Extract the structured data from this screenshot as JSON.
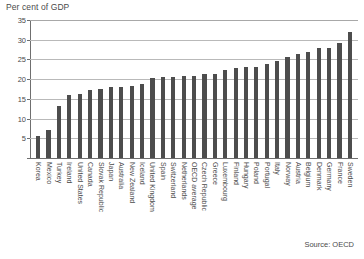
{
  "chart_data": {
    "type": "bar",
    "title": "",
    "ylabel": "Per cent of GDP",
    "xlabel": "",
    "ylim": [
      0,
      35
    ],
    "yticks": [
      0,
      5,
      10,
      15,
      20,
      25,
      30,
      35
    ],
    "grid": true,
    "legend": false,
    "source_note": "Source: OECD",
    "bar_color": "#4d4d4d",
    "categories": [
      "Korea",
      "Mexico",
      "Turkey",
      "Ireland",
      "United States",
      "Canada",
      "Slovak Republic",
      "Japan",
      "Australia",
      "New Zealand",
      "Iceland",
      "United Kingdom",
      "Spain",
      "Switzerland",
      "Netherlands",
      "OECD average",
      "Czech Republic",
      "Greece",
      "Luxembourg",
      "Finland",
      "Hungary",
      "Poland",
      "Portugal",
      "Italy",
      "Norway",
      "Austria",
      "Belgium",
      "Denmark",
      "Germany",
      "France",
      "Sweden"
    ],
    "values": [
      5.6,
      7.0,
      13.2,
      16.0,
      16.2,
      17.3,
      17.5,
      17.9,
      18.0,
      18.2,
      18.8,
      20.4,
      20.5,
      20.6,
      20.8,
      20.9,
      21.3,
      21.4,
      22.4,
      22.8,
      23.1,
      23.2,
      23.8,
      24.6,
      25.5,
      26.4,
      26.8,
      27.9,
      27.9,
      29.1,
      31.9
    ]
  },
  "figure": {
    "axis_title": "Per cent of GDP",
    "source": "Source: OECD"
  }
}
